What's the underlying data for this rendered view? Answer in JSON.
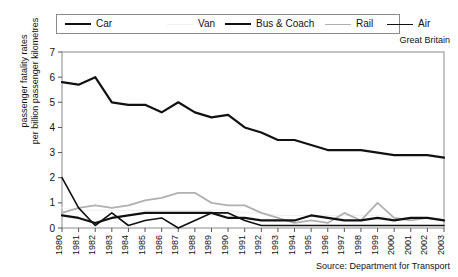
{
  "region_note": "Great Britain",
  "source_note": "Source: Department for Transport",
  "ylabel_line1": "passenger fatality rates",
  "ylabel_line2": "per billion passenger kilometres",
  "legend": {
    "items": [
      {
        "label": "Car",
        "color": "#111111",
        "width": 2.2,
        "dash": "none"
      },
      {
        "label": "Van",
        "color": "#f2f2f2",
        "width": 1.4,
        "dash": "none"
      },
      {
        "label": "Bus & Coach",
        "color": "#111111",
        "width": 2.2,
        "dash": "none"
      },
      {
        "label": "Rail",
        "color": "#b0b0b0",
        "width": 1.8,
        "dash": "none"
      },
      {
        "label": "Air",
        "color": "#111111",
        "width": 1.6,
        "dash": "none"
      }
    ]
  },
  "axes": {
    "y_ticks": [
      "0",
      "1",
      "2",
      "3",
      "4",
      "5",
      "6",
      "7"
    ],
    "x_ticks": [
      "1980",
      "1981",
      "1982",
      "1983",
      "1984",
      "1985",
      "1986",
      "1987",
      "1988",
      "1989",
      "1990",
      "1991",
      "1992",
      "1993",
      "1994",
      "1995",
      "1996",
      "1997",
      "1998",
      "1999",
      "2000",
      "2001",
      "2002",
      "2003"
    ]
  },
  "chart_data": {
    "type": "line",
    "title": "",
    "subtitle": "Great Britain",
    "xlabel": "",
    "ylabel": "passenger fatality rates per billion passenger kilometres",
    "ylim": [
      0,
      7
    ],
    "yticks": [
      0,
      1,
      2,
      3,
      4,
      5,
      6,
      7
    ],
    "grid": false,
    "legend_position": "top",
    "source": "Source: Department for Transport",
    "region": "Great Britain",
    "x": [
      1980,
      1981,
      1982,
      1983,
      1984,
      1985,
      1986,
      1987,
      1988,
      1989,
      1990,
      1991,
      1992,
      1993,
      1994,
      1995,
      1996,
      1997,
      1998,
      1999,
      2000,
      2001,
      2002,
      2003
    ],
    "series": [
      {
        "name": "Car",
        "color": "#111111",
        "values": [
          5.8,
          5.7,
          6.0,
          5.0,
          4.9,
          4.9,
          4.6,
          5.0,
          4.6,
          4.4,
          4.5,
          4.0,
          3.8,
          3.5,
          3.5,
          3.3,
          3.1,
          3.1,
          3.1,
          3.0,
          2.9,
          2.9,
          2.9,
          2.8
        ]
      },
      {
        "name": "Van",
        "color": "#f2f2f2",
        "values": [
          0.8,
          0.7,
          0.7,
          0.7,
          0.7,
          0.7,
          0.7,
          0.7,
          0.7,
          0.7,
          0.7,
          0.6,
          0.6,
          0.5,
          0.5,
          0.5,
          0.5,
          0.5,
          0.5,
          0.5,
          0.4,
          0.4,
          0.4,
          0.4
        ]
      },
      {
        "name": "Bus & Coach",
        "color": "#111111",
        "values": [
          0.5,
          0.4,
          0.2,
          0.4,
          0.5,
          0.6,
          0.6,
          0.6,
          0.6,
          0.6,
          0.4,
          0.4,
          0.3,
          0.3,
          0.3,
          0.5,
          0.4,
          0.3,
          0.3,
          0.4,
          0.3,
          0.4,
          0.4,
          0.3
        ]
      },
      {
        "name": "Rail",
        "color": "#b0b0b0",
        "values": [
          0.6,
          0.8,
          0.9,
          0.8,
          0.9,
          1.1,
          1.2,
          1.4,
          1.4,
          1.0,
          0.9,
          0.9,
          0.6,
          0.4,
          0.2,
          0.3,
          0.2,
          0.6,
          0.3,
          1.0,
          0.4,
          0.3,
          0.4,
          0.3
        ]
      },
      {
        "name": "Air",
        "color": "#111111",
        "values": [
          2.0,
          0.8,
          0.1,
          0.6,
          0.1,
          0.3,
          0.4,
          0.0,
          0.3,
          0.6,
          0.6,
          0.3,
          0.1,
          0.1,
          0.1,
          0.1,
          0.1,
          0.1,
          0.1,
          0.1,
          0.1,
          0.1,
          0.1,
          0.1
        ]
      }
    ]
  }
}
